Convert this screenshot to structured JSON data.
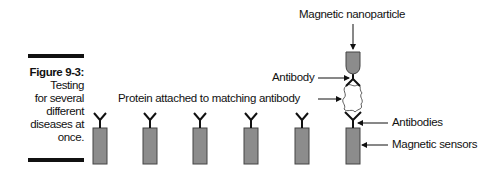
{
  "caption": {
    "title": "Figure 9-3:",
    "lines": [
      "Testing",
      "for several",
      "different",
      "diseases at",
      "once."
    ]
  },
  "labels": {
    "nanoparticle": "Magnetic nanoparticle",
    "antibody": "Antibody",
    "protein": "Protein attached to matching antibody",
    "antibodies": "Antibodies",
    "sensors": "Magnetic sensors"
  },
  "colors": {
    "sensor_fill": "#8c8c8c",
    "sensor_stroke": "#444444",
    "ink": "#111111"
  },
  "sensors": [
    {
      "x": 93
    },
    {
      "x": 143
    },
    {
      "x": 193
    },
    {
      "x": 244
    },
    {
      "x": 295
    },
    {
      "x": 346
    }
  ]
}
